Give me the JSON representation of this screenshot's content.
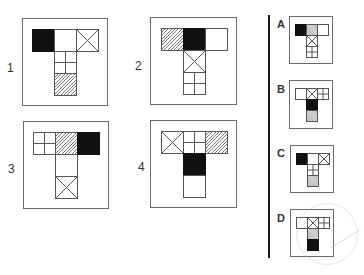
{
  "puzzle": {
    "question_figures": [
      {
        "label": "1",
        "top_row": [
          "black",
          "blank",
          "cross"
        ],
        "stem": [
          "grid",
          "hatch"
        ]
      },
      {
        "label": "2",
        "top_row": [
          "hatch",
          "black",
          "blank"
        ],
        "stem": [
          "cross",
          "grid"
        ]
      },
      {
        "label": "3",
        "top_row": [
          "grid",
          "hatch",
          "black"
        ],
        "stem": [
          "blank",
          "cross"
        ]
      },
      {
        "label": "4",
        "top_row": [
          "cross",
          "grid",
          "hatch"
        ],
        "stem": [
          "black",
          "blank"
        ]
      }
    ],
    "answer_options": [
      {
        "label": "A",
        "top_row": [
          "black",
          "grey",
          "blank"
        ],
        "stem": [
          "cross",
          "grid"
        ]
      },
      {
        "label": "B",
        "top_row": [
          "blank",
          "cross",
          "grid"
        ],
        "stem": [
          "black",
          "grey"
        ]
      },
      {
        "label": "C",
        "top_row": [
          "black",
          "blank",
          "cross"
        ],
        "stem": [
          "grid",
          "grey"
        ]
      },
      {
        "label": "D",
        "top_row": [
          "blank",
          "cross",
          "grid"
        ],
        "stem": [
          "grey",
          "black"
        ]
      }
    ]
  },
  "colors": {
    "line": "#555555",
    "fill_black": "#111111",
    "divider": "#1a1a1a"
  }
}
